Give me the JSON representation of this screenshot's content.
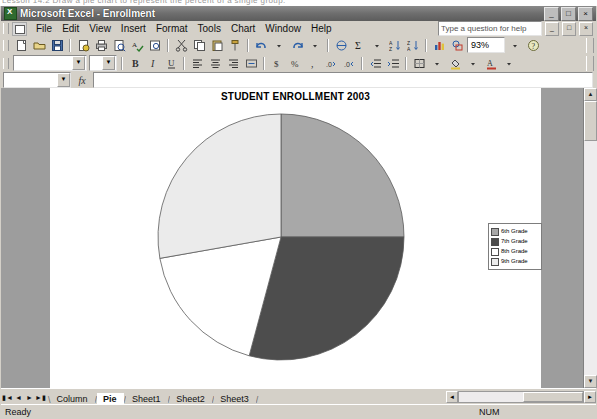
{
  "window": {
    "title": "Microsoft Excel - Enrollment",
    "app_icon": "excel-icon",
    "minimize_label": "_",
    "restore_label": "□",
    "close_label": "×"
  },
  "menu": {
    "items": [
      {
        "label": "File"
      },
      {
        "label": "Edit"
      },
      {
        "label": "View"
      },
      {
        "label": "Insert"
      },
      {
        "label": "Format"
      },
      {
        "label": "Tools"
      },
      {
        "label": "Chart"
      },
      {
        "label": "Window"
      },
      {
        "label": "Help"
      }
    ],
    "help_placeholder": "Type a question for help",
    "doc_minimize": "_",
    "doc_restore": "□",
    "doc_close": "×"
  },
  "toolbar": {
    "zoom_value": "93%",
    "font_name": "",
    "font_size": "",
    "buttons": [
      "new-icon",
      "open-icon",
      "save-icon",
      "permission-icon",
      "print-icon",
      "print-preview-icon",
      "spelling-icon",
      "research-icon",
      "cut-icon",
      "copy-icon",
      "paste-icon",
      "format-painter-icon",
      "undo-icon",
      "redo-icon",
      "hyperlink-icon",
      "autosum-icon",
      "sort-asc-icon",
      "sort-desc-icon",
      "chart-wizard-icon",
      "drawing-icon",
      "zoom-icon",
      "help-icon"
    ],
    "format_buttons": [
      "bold-icon",
      "italic-icon",
      "underline-icon",
      "align-left-icon",
      "align-center-icon",
      "align-right-icon",
      "merge-center-icon",
      "currency-icon",
      "percent-icon",
      "comma-icon",
      "increase-decimal-icon",
      "decrease-decimal-icon",
      "decrease-indent-icon",
      "increase-indent-icon",
      "borders-icon",
      "fill-color-icon",
      "font-color-icon"
    ]
  },
  "formula_bar": {
    "name_box_value": "",
    "fx_label": "fx",
    "formula_value": ""
  },
  "chart": {
    "title": "STUDENT ENROLLMENT 2003"
  },
  "chart_data": {
    "type": "pie",
    "title": "STUDENT ENROLLMENT 2003",
    "xlabel": "",
    "ylabel": "",
    "legend_position": "right",
    "grid": false,
    "categories": [
      "6th Grade",
      "7th Grade",
      "8th Grade",
      "9th Grade"
    ],
    "values": [
      25,
      29,
      18,
      28
    ],
    "units": "percent",
    "start_angle_deg": 0,
    "direction": "clockwise",
    "slices": [
      {
        "label": "6th Grade",
        "percent": 25,
        "angle_deg": 90,
        "color": "#a8a8a8"
      },
      {
        "label": "7th Grade",
        "percent": 29,
        "angle_deg": 105,
        "color": "#4d4d4d"
      },
      {
        "label": "8th Grade",
        "percent": 18,
        "angle_deg": 65,
        "color": "#ffffff"
      },
      {
        "label": "9th Grade",
        "percent": 28,
        "angle_deg": 100,
        "color": "#ebebeb"
      }
    ],
    "legend": [
      {
        "label": "6th Grade",
        "color": "#a8a8a8"
      },
      {
        "label": "7th Grade",
        "color": "#4d4d4d"
      },
      {
        "label": "8th Grade",
        "color": "#ffffff"
      },
      {
        "label": "9th Grade",
        "color": "#ebebeb"
      }
    ]
  },
  "sheet_tabs": {
    "first_label": "▮◄",
    "prev_label": "◄",
    "next_label": "►",
    "last_label": "►▮",
    "tabs": [
      {
        "label": "Column",
        "active": false
      },
      {
        "label": "Pie",
        "active": true
      },
      {
        "label": "Sheet1",
        "active": false
      },
      {
        "label": "Sheet2",
        "active": false
      },
      {
        "label": "Sheet3",
        "active": false
      }
    ]
  },
  "status_bar": {
    "status": "Ready",
    "num_lock": "NUM"
  },
  "scroll": {
    "up_arrow": "▲",
    "down_arrow": "▼",
    "left_arrow": "◄",
    "right_arrow": "►"
  },
  "scan_text": "Lesson 14.2    Draw a pie chart to represent the percent of a single group."
}
